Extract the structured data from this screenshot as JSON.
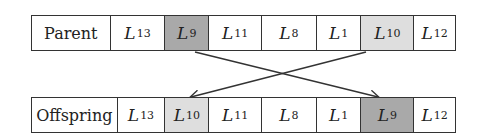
{
  "parent": {
    "label": "Parent",
    "genes": [
      {
        "letter": "L",
        "sub": "13",
        "shade": "none"
      },
      {
        "letter": "L",
        "sub": "9",
        "shade": "dark"
      },
      {
        "letter": "L",
        "sub": "11",
        "shade": "none"
      },
      {
        "letter": "L",
        "sub": "8",
        "shade": "none"
      },
      {
        "letter": "L",
        "sub": "1",
        "shade": "none"
      },
      {
        "letter": "L",
        "sub": "10",
        "shade": "light"
      },
      {
        "letter": "L",
        "sub": "12",
        "shade": "none"
      }
    ]
  },
  "offspring": {
    "label": "Offspring",
    "genes": [
      {
        "letter": "L",
        "sub": "13",
        "shade": "none"
      },
      {
        "letter": "L",
        "sub": "10",
        "shade": "light"
      },
      {
        "letter": "L",
        "sub": "11",
        "shade": "none"
      },
      {
        "letter": "L",
        "sub": "8",
        "shade": "none"
      },
      {
        "letter": "L",
        "sub": "1",
        "shade": "none"
      },
      {
        "letter": "L",
        "sub": "9",
        "shade": "dark"
      },
      {
        "letter": "L",
        "sub": "12",
        "shade": "none"
      }
    ]
  },
  "swap": {
    "from_index_a": 1,
    "to_index_a": 5,
    "from_index_b": 5,
    "to_index_b": 1
  },
  "colors": {
    "dark": "#a9a9a9",
    "light": "#dedede",
    "line": "#333333"
  }
}
